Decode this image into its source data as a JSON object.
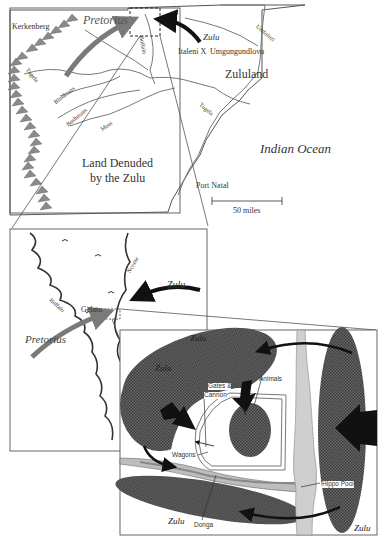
{
  "overview_map": {
    "places": {
      "kerkenberg": "Kerkenberg",
      "italeni": "Italeni",
      "italeni_marker": "X",
      "umgungundlovu": "Umgungundlovu",
      "zululand": "Zululand",
      "indian_ocean": "Indian Ocean",
      "land_denuded_line1": "Land Denuded",
      "land_denuded_line2": "by the Zulu",
      "port_natal": "Port Natal"
    },
    "rivers": {
      "tugela_west": "Tugela",
      "bloukrans": "Bloukrans",
      "bushmans": "Bushmans",
      "mooi": "Mooi",
      "buffalo": "Buffalo",
      "umfolozi": "Umfolozi",
      "tugela_east": "Tugela"
    },
    "forces": {
      "pretorius": "Pretorius",
      "zulu": "Zulu"
    },
    "scale_label": "50 miles"
  },
  "detail_map": {
    "places": {
      "gelato": "Gelato"
    },
    "rivers": {
      "buffalo": "Buffalo",
      "ncome": "Ncome"
    },
    "forces": {
      "pretorius": "Pretorius",
      "zulu": "Zulu"
    }
  },
  "battle_diagram": {
    "labels": {
      "gates_line1": "Gates &",
      "gates_line2": "Cannon",
      "animals": "Animals",
      "wagons": "Wagons",
      "hippo_pool": "Hippo Pool",
      "donga": "Donga"
    },
    "zulu_labels": [
      "Zulu",
      "Zulu",
      "Zulu",
      "Zulu"
    ]
  },
  "colors": {
    "pretorius_arrow": "#7a7a7a",
    "zulu_arrow": "#111111",
    "zulu_mass": "#5a5a5a",
    "river_fill": "#cfcfcf",
    "mountain": "#8a8a8a",
    "line": "#444444"
  }
}
